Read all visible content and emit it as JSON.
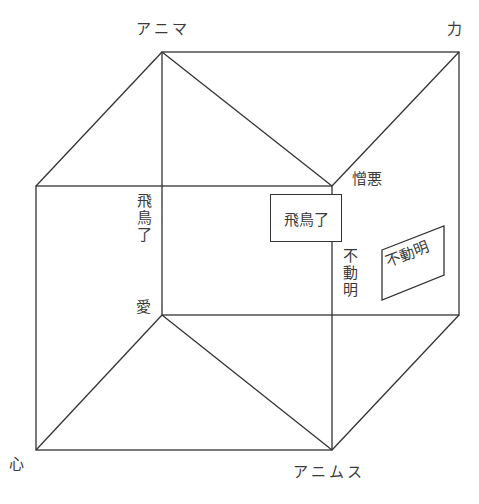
{
  "diagram": {
    "type": "cube-model",
    "vertices": {
      "top_back_left": "アニマ",
      "top_back_right": "力",
      "front_bottom_left": "心",
      "front_bottom_right": "アニムス"
    },
    "labels": {
      "hatred": "憎悪",
      "love": "愛",
      "asuka_vertical": "飛鳥了",
      "fudo_vertical": "不動明",
      "asuka_boxed": "飛鳥了",
      "fudo_boxed": "不動明"
    },
    "colors": {
      "line": "#333333",
      "text": "#3a3a3a",
      "background": "#ffffff"
    }
  }
}
